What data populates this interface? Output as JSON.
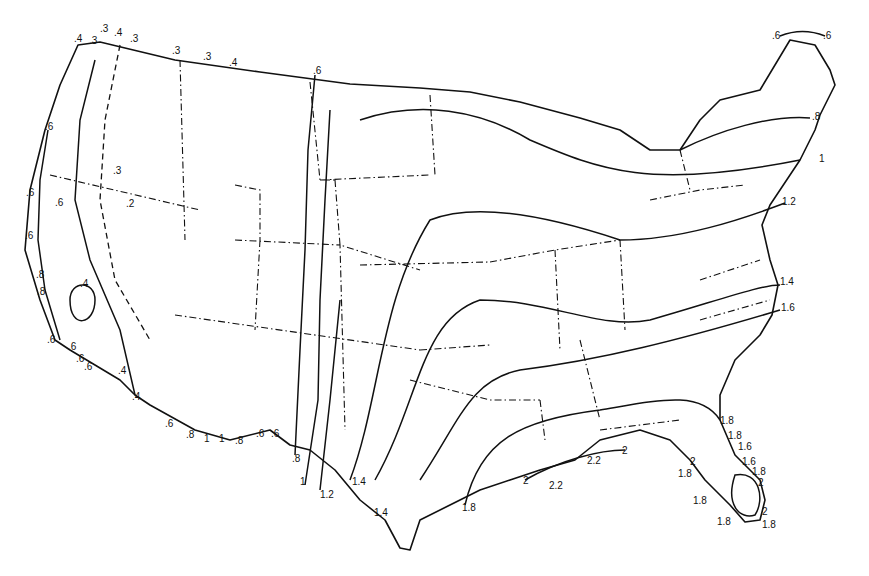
{
  "map": {
    "type": "isoline map of the contiguous United States",
    "labels": [
      {
        "text": ".4",
        "x": 74,
        "y": 40
      },
      {
        "text": ".3",
        "x": 89,
        "y": 42
      },
      {
        "text": ".3",
        "x": 100,
        "y": 30
      },
      {
        "text": ".4",
        "x": 114,
        "y": 34
      },
      {
        "text": ".3",
        "x": 130,
        "y": 40
      },
      {
        "text": ".3",
        "x": 172,
        "y": 52
      },
      {
        "text": ".3",
        "x": 203,
        "y": 58
      },
      {
        "text": ".4",
        "x": 229,
        "y": 64
      },
      {
        "text": ".6",
        "x": 313,
        "y": 72
      },
      {
        "text": ".6",
        "x": 45,
        "y": 128
      },
      {
        "text": ".3",
        "x": 113,
        "y": 172
      },
      {
        "text": ".2",
        "x": 126,
        "y": 205
      },
      {
        "text": ".6",
        "x": 26,
        "y": 194
      },
      {
        "text": ".6",
        "x": 55,
        "y": 204
      },
      {
        "text": ".6",
        "x": 25,
        "y": 237
      },
      {
        "text": ".8",
        "x": 36,
        "y": 276
      },
      {
        "text": ".8",
        "x": 37,
        "y": 293
      },
      {
        "text": ".4",
        "x": 80,
        "y": 285
      },
      {
        "text": ".6",
        "x": 47,
        "y": 341
      },
      {
        "text": ".6",
        "x": 68,
        "y": 348
      },
      {
        "text": ".6",
        "x": 76,
        "y": 360
      },
      {
        "text": ".6",
        "x": 84,
        "y": 368
      },
      {
        "text": ".4",
        "x": 118,
        "y": 372
      },
      {
        "text": ".4",
        "x": 132,
        "y": 398
      },
      {
        "text": ".6",
        "x": 165,
        "y": 425
      },
      {
        "text": ".8",
        "x": 186,
        "y": 436
      },
      {
        "text": "1",
        "x": 204,
        "y": 440
      },
      {
        "text": "1",
        "x": 219,
        "y": 440
      },
      {
        "text": ".8",
        "x": 235,
        "y": 442
      },
      {
        "text": ".6",
        "x": 256,
        "y": 435
      },
      {
        "text": ".6",
        "x": 271,
        "y": 435
      },
      {
        "text": ".8",
        "x": 292,
        "y": 460
      },
      {
        "text": "1",
        "x": 300,
        "y": 483
      },
      {
        "text": "1.2",
        "x": 320,
        "y": 496
      },
      {
        "text": "1.4",
        "x": 352,
        "y": 483
      },
      {
        "text": "1.4",
        "x": 374,
        "y": 514
      },
      {
        "text": "1.8",
        "x": 462,
        "y": 509
      },
      {
        "text": "2",
        "x": 523,
        "y": 482
      },
      {
        "text": "2.2",
        "x": 549,
        "y": 487
      },
      {
        "text": "2.2",
        "x": 587,
        "y": 462
      },
      {
        "text": "2",
        "x": 622,
        "y": 452
      },
      {
        "text": "1.8",
        "x": 720,
        "y": 422
      },
      {
        "text": "1.8",
        "x": 728,
        "y": 437
      },
      {
        "text": "1.6",
        "x": 738,
        "y": 448
      },
      {
        "text": "1.6",
        "x": 742,
        "y": 463
      },
      {
        "text": "1.8",
        "x": 752,
        "y": 473
      },
      {
        "text": "2",
        "x": 690,
        "y": 463
      },
      {
        "text": "1.8",
        "x": 678,
        "y": 475
      },
      {
        "text": "2",
        "x": 758,
        "y": 484
      },
      {
        "text": "1.8",
        "x": 693,
        "y": 502
      },
      {
        "text": "2",
        "x": 762,
        "y": 513
      },
      {
        "text": "1.8",
        "x": 717,
        "y": 523
      },
      {
        "text": "1.8",
        "x": 762,
        "y": 526
      },
      {
        "text": ".6",
        "x": 772,
        "y": 37
      },
      {
        "text": ".6",
        "x": 823,
        "y": 37
      },
      {
        "text": ".8",
        "x": 812,
        "y": 118
      },
      {
        "text": "1",
        "x": 819,
        "y": 160
      },
      {
        "text": "1.2",
        "x": 782,
        "y": 203
      },
      {
        "text": "1.4",
        "x": 780,
        "y": 283
      },
      {
        "text": "1.6",
        "x": 781,
        "y": 309
      }
    ]
  }
}
